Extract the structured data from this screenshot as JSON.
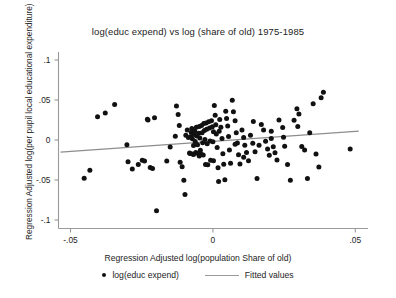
{
  "chart_data": {
    "type": "scatter",
    "title": "log(educ expend) vs log (share of old) 1975-1985",
    "xlabel": "Regression Adjusted log(population Share of old)",
    "ylabel": "Regression Adjusted log(per pupil local educational expenditure)",
    "xlim": [
      -0.055,
      0.052
    ],
    "ylim": [
      -0.115,
      0.112
    ],
    "xticks": [
      -0.05,
      0,
      0.05
    ],
    "xtick_labels": [
      "-.05",
      "0",
      ".05"
    ],
    "yticks": [
      0.1,
      0.05,
      0,
      -0.05,
      -0.1
    ],
    "ytick_labels": [
      ".1",
      ".05",
      "0",
      "-.05",
      "-.1"
    ],
    "grid": false,
    "legend_position": "below",
    "marker_color": "#111111",
    "line_color": "#8d8d8d",
    "axis_color": "#9a9a9a",
    "series": [
      {
        "name": "log(educ expend)",
        "type": "scatter",
        "points": [
          [
            -0.0452,
            -0.0477
          ],
          [
            -0.0432,
            -0.0378
          ],
          [
            -0.0405,
            0.029
          ],
          [
            -0.0378,
            0.0338
          ],
          [
            -0.0345,
            0.0443
          ],
          [
            -0.0302,
            -0.0059
          ],
          [
            -0.0298,
            -0.0272
          ],
          [
            -0.0283,
            -0.0364
          ],
          [
            -0.0262,
            -0.0306
          ],
          [
            -0.0248,
            -0.0252
          ],
          [
            -0.024,
            -0.0263
          ],
          [
            -0.023,
            0.0259
          ],
          [
            -0.0228,
            0.025
          ],
          [
            -0.022,
            -0.0345
          ],
          [
            -0.0212,
            -0.0355
          ],
          [
            -0.0205,
            0.0278
          ],
          [
            -0.0198,
            -0.0885
          ],
          [
            -0.0162,
            -0.0262
          ],
          [
            -0.015,
            -0.0088
          ],
          [
            -0.0132,
            0.0046
          ],
          [
            -0.0128,
            0.0425
          ],
          [
            -0.0122,
            0.0318
          ],
          [
            -0.0118,
            0.018
          ],
          [
            -0.0115,
            -0.0278
          ],
          [
            -0.0108,
            -0.0335
          ],
          [
            -0.0102,
            -0.0502
          ],
          [
            -0.0098,
            -0.068
          ],
          [
            -0.0095,
            0.006
          ],
          [
            -0.009,
            0.0125
          ],
          [
            -0.0086,
            0.003
          ],
          [
            -0.0082,
            -0.0162
          ],
          [
            -0.008,
            -0.0168
          ],
          [
            -0.0078,
            0.0042
          ],
          [
            -0.0076,
            0.0095
          ],
          [
            -0.0074,
            0.0145
          ],
          [
            -0.0072,
            0.0015
          ],
          [
            -0.007,
            -0.0175
          ],
          [
            -0.0068,
            -0.0182
          ],
          [
            -0.0066,
            0.0068
          ],
          [
            -0.0064,
            0.0112
          ],
          [
            -0.0062,
            -0.002
          ],
          [
            -0.006,
            -0.0155
          ],
          [
            -0.0058,
            0.0158
          ],
          [
            -0.0056,
            0.005
          ],
          [
            -0.0054,
            -0.0058
          ],
          [
            -0.0052,
            -0.0168
          ],
          [
            -0.005,
            0.0085
          ],
          [
            -0.0048,
            0.017
          ],
          [
            -0.0046,
            0.0025
          ],
          [
            -0.0044,
            -0.0128
          ],
          [
            -0.0042,
            -0.0175
          ],
          [
            -0.004,
            0.0182
          ],
          [
            -0.0038,
            0.009
          ],
          [
            -0.0036,
            -0.0035
          ],
          [
            -0.0034,
            -0.0188
          ],
          [
            -0.0032,
            0.0205
          ],
          [
            -0.003,
            0.0118
          ],
          [
            -0.0028,
            0.0005
          ],
          [
            -0.0026,
            -0.0305
          ],
          [
            -0.0024,
            0.0212
          ],
          [
            -0.0022,
            0.0135
          ],
          [
            -0.002,
            -0.0048
          ],
          [
            -0.0018,
            -0.031
          ],
          [
            -0.0015,
            0.0228
          ],
          [
            -0.0012,
            0.015
          ],
          [
            -0.001,
            -0.0012
          ],
          [
            -0.0008,
            -0.0252
          ],
          [
            -0.0005,
            0.024
          ],
          [
            -0.0002,
            0.0165
          ],
          [
            0.0,
            -0.0022
          ],
          [
            0.0002,
            -0.026
          ],
          [
            0.0005,
            0.043
          ],
          [
            0.0008,
            0.031
          ],
          [
            0.001,
            0.0192
          ],
          [
            0.0012,
            0.0075
          ],
          [
            0.0015,
            -0.0095
          ],
          [
            0.0018,
            -0.0348
          ],
          [
            0.002,
            -0.052
          ],
          [
            0.0024,
            0.0255
          ],
          [
            0.0028,
            0.016
          ],
          [
            0.0032,
            0.002
          ],
          [
            0.0035,
            -0.0172
          ],
          [
            0.0038,
            -0.0302
          ],
          [
            0.0042,
            -0.0498
          ],
          [
            0.0045,
            0.036
          ],
          [
            0.0048,
            0.027
          ],
          [
            0.0052,
            0.0175
          ],
          [
            0.0055,
            0.0045
          ],
          [
            0.0058,
            -0.0125
          ],
          [
            0.0062,
            -0.029
          ],
          [
            0.0068,
            0.0498
          ],
          [
            0.0072,
            0.0352
          ],
          [
            0.0078,
            0.024
          ],
          [
            0.0082,
            0.009
          ],
          [
            0.0086,
            -0.0038
          ],
          [
            0.009,
            -0.0185
          ],
          [
            0.0095,
            -0.03
          ],
          [
            0.0102,
            0.0125
          ],
          [
            0.0108,
            0.0032
          ],
          [
            0.0112,
            -0.0065
          ],
          [
            0.0118,
            -0.0155
          ],
          [
            0.0125,
            -0.0258
          ],
          [
            0.0132,
            0.0058
          ],
          [
            0.014,
            -0.0042
          ],
          [
            0.0148,
            -0.0148
          ],
          [
            0.0155,
            -0.0482
          ],
          [
            0.0162,
            -0.0065
          ],
          [
            0.017,
            0.0195
          ],
          [
            0.0178,
            0.0125
          ],
          [
            0.0185,
            -0.0015
          ],
          [
            0.0192,
            -0.0112
          ],
          [
            0.0198,
            -0.0192
          ],
          [
            0.0205,
            0.0018
          ],
          [
            0.0212,
            -0.0085
          ],
          [
            0.0218,
            -0.016
          ],
          [
            0.0225,
            -0.025
          ],
          [
            0.0232,
            0.025
          ],
          [
            0.0245,
            0.0155
          ],
          [
            0.0252,
            -0.0078
          ],
          [
            0.0262,
            -0.0305
          ],
          [
            0.0272,
            -0.0502
          ],
          [
            0.0285,
            0.0248
          ],
          [
            0.0295,
            0.039
          ],
          [
            0.0302,
            0.0325
          ],
          [
            0.0312,
            -0.0082
          ],
          [
            0.0322,
            -0.0125
          ],
          [
            0.0332,
            -0.048
          ],
          [
            0.034,
            0.009
          ],
          [
            0.0352,
            0.0452
          ],
          [
            0.0362,
            -0.0175
          ],
          [
            0.0372,
            -0.0338
          ],
          [
            0.038,
            0.0528
          ],
          [
            0.0388,
            0.0598
          ],
          [
            0.0482,
            -0.0112
          ],
          [
            -0.0068,
            -0.0068
          ],
          [
            -0.0048,
            -0.02
          ],
          [
            0.0002,
            0.0102
          ],
          [
            0.0022,
            0.0108
          ],
          [
            0.0078,
            -0.0052
          ],
          [
            0.0108,
            -0.0215
          ],
          [
            0.0142,
            0.0232
          ],
          [
            0.0205,
            0.0108
          ],
          [
            0.0248,
            0.0035
          ],
          [
            0.0298,
            0.0168
          ]
        ]
      },
      {
        "name": "Fitted values",
        "type": "line",
        "endpoints": [
          [
            -0.0535,
            -0.0152
          ],
          [
            0.0512,
            0.0112
          ]
        ]
      }
    ]
  },
  "legend": {
    "entries": [
      {
        "label": "log(educ expend)",
        "marker": "dot"
      },
      {
        "label": "Fitted values",
        "marker": "line"
      }
    ]
  }
}
